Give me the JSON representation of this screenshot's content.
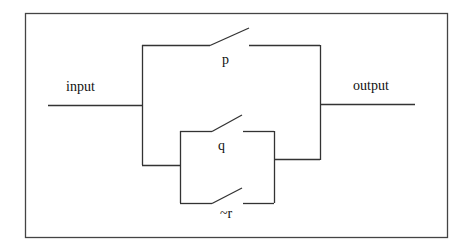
{
  "diagram": {
    "type": "switching circuit",
    "labels": {
      "input": "input",
      "output": "output",
      "switch_p": "p",
      "switch_q": "q",
      "switch_not_r": "~r"
    },
    "colors": {
      "line": "#333333",
      "background": "#ffffff"
    },
    "structure": "p in parallel with (q in parallel with ~r)"
  }
}
